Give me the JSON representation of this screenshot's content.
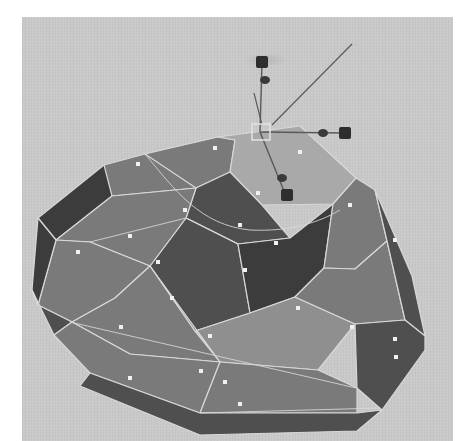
{
  "viewport": {
    "background": "#c9c9c9",
    "offset": [
      22,
      17
    ]
  },
  "colors": {
    "face_light": "#8f8f8f",
    "face_mid": "#7a7a7a",
    "face_dark": "#4f4f4f",
    "face_darker": "#3c3c3c",
    "face_selected": "#a9a9a9",
    "edge": "#d8d8d8",
    "face_center_dot": "#f0f0f0",
    "manipulator": "#2e2e2e",
    "manipulator_line": "#5a5a5a",
    "selection_box": "#e4e4e4"
  },
  "mesh": {
    "name": "polygon-dome-mesh",
    "faces": [
      {
        "id": "rim-left-back",
        "tone": "face_darker",
        "points": "38,218 104,165 145,154 112,196 56,240"
      },
      {
        "id": "top-back-left",
        "tone": "face_mid",
        "points": "104,165 145,154 218,137 196,188 112,196"
      },
      {
        "id": "top-back-center",
        "tone": "face_mid",
        "points": "145,154 218,137 235,140 230,172 196,188"
      },
      {
        "id": "top-selected",
        "tone": "face_selected",
        "points": "218,137 300,126 356,178 333,204 262,205 230,172 235,140"
      },
      {
        "id": "inner-dark-left",
        "tone": "face_dark",
        "points": "196,188 230,172 262,205 290,238 238,244 186,218"
      },
      {
        "id": "inner-dark-front",
        "tone": "face_dark",
        "points": "186,218 238,244 250,313 195,331 150,266"
      },
      {
        "id": "inner-dark-right",
        "tone": "face_darker",
        "points": "238,244 290,238 333,204 324,268 295,297 250,313"
      },
      {
        "id": "side-right-upper",
        "tone": "face_mid",
        "points": "333,204 356,178 375,190 387,241 355,269 324,268"
      },
      {
        "id": "tier-left",
        "tone": "face_mid",
        "points": "112,196 196,188 186,218 150,266 90,242 56,240"
      },
      {
        "id": "tier-left-lower",
        "tone": "face_mid",
        "points": "56,240 90,242 150,266 115,298 72,322 38,305"
      },
      {
        "id": "rim-left-side",
        "tone": "face_darker",
        "points": "38,218 56,240 38,305 32,290"
      },
      {
        "id": "rim-left-side-2",
        "tone": "face_dark",
        "points": "32,290 38,305 72,322 54,335"
      },
      {
        "id": "tier-front-left",
        "tone": "face_mid",
        "points": "72,322 115,298 150,266 195,331 220,362 130,354"
      },
      {
        "id": "tier-front",
        "tone": "face_light",
        "points": "150,266 195,331 250,313 295,297 355,324 318,370 220,362"
      },
      {
        "id": "tier-right",
        "tone": "face_mid",
        "points": "295,297 324,268 355,269 387,241 405,320 355,324"
      },
      {
        "id": "rim-right",
        "tone": "face_dark",
        "points": "375,190 387,241 405,320 425,336 412,276"
      },
      {
        "id": "rim-right-lower",
        "tone": "face_dark",
        "points": "355,324 405,320 425,336 425,350 382,410 357,388"
      },
      {
        "id": "band-front-left",
        "tone": "face_mid",
        "points": "54,335 72,322 130,354 220,362 200,413 90,373"
      },
      {
        "id": "band-front",
        "tone": "face_mid",
        "points": "220,362 318,370 357,388 357,413 200,413"
      },
      {
        "id": "band-front-bottom",
        "tone": "face_dark",
        "points": "90,373 200,413 357,413 382,410 357,431 200,435 80,386"
      }
    ],
    "extra_edges": [
      "M 145 154 C 175 190, 200 225, 250 230 C 290 232, 320 222, 340 210",
      "M 90 242 L 186 218",
      "M 186 218 L 238 244",
      "M 70 322 L 356 388",
      "M 200 413 L 380 408"
    ],
    "face_dots": [
      [
        215,
        148
      ],
      [
        138,
        164
      ],
      [
        300,
        152
      ],
      [
        185,
        210
      ],
      [
        240,
        225
      ],
      [
        258,
        193
      ],
      [
        276,
        243
      ],
      [
        245,
        270
      ],
      [
        350,
        205
      ],
      [
        395,
        240
      ],
      [
        130,
        236
      ],
      [
        78,
        252
      ],
      [
        158,
        262
      ],
      [
        172,
        298
      ],
      [
        210,
        336
      ],
      [
        298,
        308
      ],
      [
        352,
        327
      ],
      [
        396,
        357
      ],
      [
        121,
        327
      ],
      [
        130,
        378
      ],
      [
        201,
        371
      ],
      [
        225,
        382
      ],
      [
        240,
        404
      ],
      [
        395,
        339
      ]
    ]
  },
  "manipulator": {
    "tool": "move-tool",
    "pivot": [
      260,
      132
    ],
    "selection_box": {
      "x": 252,
      "y": 124,
      "w": 18,
      "h": 16
    },
    "axes": [
      {
        "axis": "y",
        "line_end": [
          262,
          62
        ],
        "cone": [
          265,
          80
        ],
        "cube": [
          262,
          62
        ]
      },
      {
        "axis": "x",
        "line_end": [
          345,
          133
        ],
        "cone": [
          323,
          133
        ],
        "cube": [
          345,
          133
        ]
      },
      {
        "axis": "z",
        "line_end": [
          286,
          196
        ],
        "cone": [
          282,
          178
        ],
        "cube": [
          287,
          195
        ]
      }
    ],
    "view_line": {
      "from": [
        272,
        125
      ],
      "to": [
        352,
        44
      ]
    },
    "secondary_line": {
      "from": [
        262,
        125
      ],
      "to": [
        254,
        93
      ]
    }
  }
}
